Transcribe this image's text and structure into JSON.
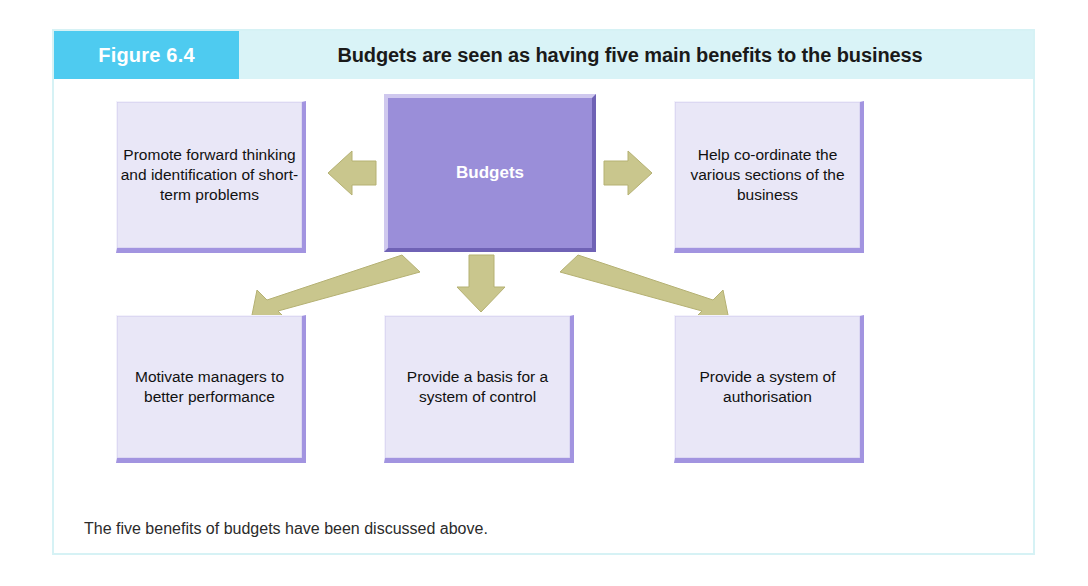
{
  "figure": {
    "number_label": "Figure 6.4",
    "title": "Budgets are seen as having five main benefits to the business",
    "caption": "The five benefits of budgets have been discussed above."
  },
  "colors": {
    "header_band": "#d9f3f7",
    "number_box": "#4ecbf0",
    "center_node_fill": "#9a8ed9",
    "benefit_node_fill": "#e9e7f7",
    "node_shadow": "#a294e0",
    "arrow_fill": "#c9c68d",
    "arrow_stroke": "#b5b173",
    "frame_border": "#d6f2f5",
    "title_text": "#1a1a1a"
  },
  "diagram": {
    "type": "hub-and-spoke",
    "center": {
      "id": "budgets",
      "label": "Budgets"
    },
    "benefits": [
      {
        "id": "forward-thinking",
        "label": "Promote forward thinking and identification of short-term problems",
        "position": "top-left"
      },
      {
        "id": "coordinate",
        "label": "Help co-ordinate the various sections of the business",
        "position": "top-right"
      },
      {
        "id": "motivate",
        "label": "Motivate managers to better performance",
        "position": "bottom-left"
      },
      {
        "id": "control",
        "label": "Provide a basis for a system of control",
        "position": "bottom-middle"
      },
      {
        "id": "authorisation",
        "label": "Provide a system of authorisation",
        "position": "bottom-right"
      }
    ],
    "arrows": [
      {
        "id": "arrow-to-forward-thinking",
        "direction": "left",
        "from": "budgets",
        "to": "forward-thinking"
      },
      {
        "id": "arrow-to-coordinate",
        "direction": "right",
        "from": "budgets",
        "to": "coordinate"
      },
      {
        "id": "arrow-to-motivate",
        "direction": "down-left",
        "from": "budgets",
        "to": "motivate"
      },
      {
        "id": "arrow-to-control",
        "direction": "down",
        "from": "budgets",
        "to": "control"
      },
      {
        "id": "arrow-to-authorisation",
        "direction": "down-right",
        "from": "budgets",
        "to": "authorisation"
      }
    ]
  }
}
